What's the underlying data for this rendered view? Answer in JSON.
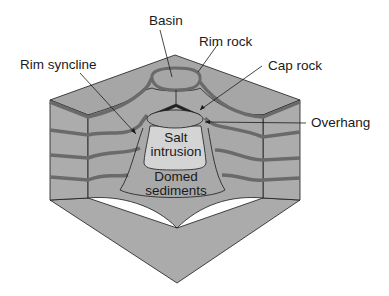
{
  "diagram": {
    "colors": {
      "block_fill": "#a8a8a8",
      "front_fill": "#b0b0b0",
      "bed_dark": "#6e6e6e",
      "salt_fill": "#d6d6d6",
      "outline": "#1a1a1a"
    },
    "labels": {
      "basin": "Basin",
      "rim_rock": "Rim rock",
      "rim_syncline": "Rim syncline",
      "cap_rock": "Cap rock",
      "overhang": "Overhang",
      "salt_intrusion_1": "Salt",
      "salt_intrusion_2": "intrusion",
      "domed_sediments_1": "Domed",
      "domed_sediments_2": "sediments"
    }
  }
}
